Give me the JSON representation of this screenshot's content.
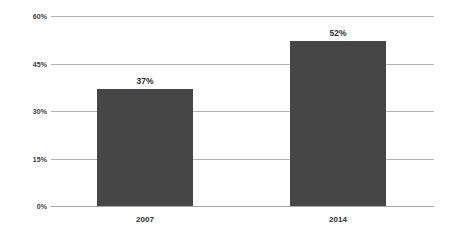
{
  "chart_data": {
    "type": "bar",
    "title": "",
    "xlabel": "",
    "ylabel": "",
    "categories": [
      "2007",
      "2014"
    ],
    "values": [
      37,
      52
    ],
    "value_labels": [
      "37%",
      "52%"
    ],
    "ylim": [
      0,
      60
    ],
    "yticks": [
      60,
      45,
      30,
      15,
      0
    ],
    "ytick_labels": [
      "60%",
      "45%",
      "30%",
      "15%",
      "0%"
    ],
    "grid": true,
    "legend": "none",
    "series": [
      {
        "name": "",
        "values": [
          37,
          52
        ],
        "color": "#464646"
      }
    ],
    "colors": {
      "bar": "#464646",
      "gridline": "#b3b3b3",
      "axis": "#a6a6a6",
      "text": "#2e2e2e",
      "background": "#ffffff"
    }
  }
}
